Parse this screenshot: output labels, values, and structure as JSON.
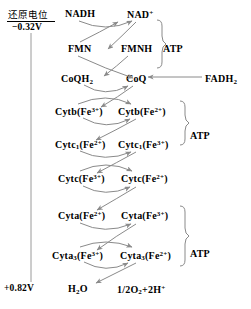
{
  "diagram": {
    "title_note": "Electron transport chain / respiratory chain redox diagram",
    "axis": {
      "caption": "还原电位",
      "top_value": "−0.32V",
      "bottom_value": "+0.82V"
    },
    "rows": [
      {
        "id": "row-nad",
        "left": "NADH",
        "right": "NAD",
        "right_sup": "+"
      },
      {
        "id": "row-fmn",
        "left": "FMN",
        "right": "FMNH"
      },
      {
        "id": "row-coq",
        "left": "CoQH",
        "left_sub": "2",
        "right": "CoQ"
      },
      {
        "id": "row-cytb",
        "left_name": "Cytb",
        "left_ion": "Fe",
        "left_charge": "3+",
        "right_name": "Cytb",
        "right_ion": "Fe",
        "right_charge": "2+"
      },
      {
        "id": "row-cytc1",
        "left_name": "Cytc",
        "left_name_sub": "1",
        "left_ion": "Fe",
        "left_charge": "2+",
        "right_name": "Cytc",
        "right_name_sub": "1",
        "right_ion": "Fe",
        "right_charge": "3+"
      },
      {
        "id": "row-cytc",
        "left_name": "Cytc",
        "left_ion": "Fe",
        "left_charge": "3+",
        "right_name": "Cytc",
        "right_ion": "Fe",
        "right_charge": "2+"
      },
      {
        "id": "row-cyta",
        "left_name": "Cyta",
        "left_ion": "Fe",
        "left_charge": "2+",
        "right_name": "Cyta",
        "right_ion": "Fe",
        "right_charge": "3+"
      },
      {
        "id": "row-cyta3",
        "left_name": "Cyta",
        "left_name_sub": "3",
        "left_ion": "Fe",
        "left_charge": "3+",
        "right_name": "Cyta",
        "right_name_sub": "3",
        "right_ion": "Fe",
        "right_charge": "2+"
      },
      {
        "id": "row-water",
        "left": "H",
        "left_sub": "2",
        "left_tail": "O",
        "right": "1/2O",
        "right_sub": "2",
        "right_tail": "+2H",
        "right_sup": "+"
      }
    ],
    "atp_labels": [
      {
        "id": "atp-1",
        "text": "ATP"
      },
      {
        "id": "atp-2",
        "text": "ATP"
      },
      {
        "id": "atp-3",
        "text": "ATP"
      }
    ],
    "side_input": {
      "label": "FADH",
      "sub": "2"
    },
    "colors": {
      "text": "#000000",
      "arrow": "#808080",
      "bracket": "#888888",
      "axis_line": "#999999"
    }
  }
}
